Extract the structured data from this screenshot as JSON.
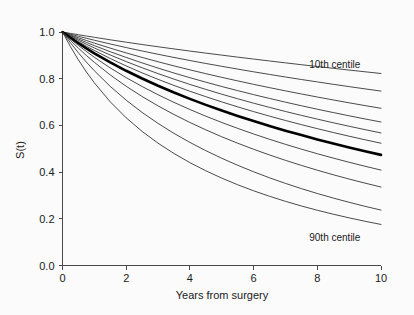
{
  "chart_data": {
    "type": "line",
    "title": "",
    "subtitle": "",
    "xlabel": "Years from surgery",
    "ylabel": "S(t)",
    "xlim": [
      0,
      10
    ],
    "ylim": [
      0.0,
      1.0
    ],
    "xticks": [
      0,
      2,
      4,
      6,
      8,
      10
    ],
    "xtick_labels": [
      "0",
      "2",
      "4",
      "6",
      "8",
      "10"
    ],
    "yticks": [
      0.0,
      0.2,
      0.4,
      0.6,
      0.8,
      1.0
    ],
    "ytick_labels": [
      "0.0",
      "0.2",
      "0.4",
      "0.6",
      "0.8",
      "1.0"
    ],
    "grid": false,
    "legend_position": "none",
    "annotations": [
      {
        "text": "10th centile",
        "x": 8.55,
        "y": 0.845,
        "name": "annotation-10th-centile"
      },
      {
        "text": "90th centile",
        "x": 8.55,
        "y": 0.105,
        "name": "annotation-90th-centile"
      }
    ],
    "x": [
      0,
      0.25,
      0.5,
      0.75,
      1,
      1.5,
      2,
      2.5,
      3,
      3.5,
      4,
      4.5,
      5,
      5.5,
      6,
      6.5,
      7,
      7.5,
      8,
      8.5,
      9,
      9.5,
      10
    ],
    "series": [
      {
        "name": "10th centile",
        "emphasis": "thin",
        "values": [
          1.0,
          0.9941,
          0.9884,
          0.9828,
          0.9773,
          0.9666,
          0.9563,
          0.9464,
          0.9368,
          0.9275,
          0.9184,
          0.9096,
          0.9009,
          0.8924,
          0.8841,
          0.8759,
          0.8679,
          0.86,
          0.8522,
          0.8446,
          0.837,
          0.8296,
          0.8223
        ]
      },
      {
        "name": "centile 2",
        "emphasis": "thin",
        "values": [
          1.0,
          0.9907,
          0.9818,
          0.9732,
          0.9648,
          0.9487,
          0.9333,
          0.9187,
          0.9046,
          0.891,
          0.8779,
          0.8652,
          0.853,
          0.8411,
          0.8295,
          0.8183,
          0.8073,
          0.7966,
          0.7862,
          0.776,
          0.7661,
          0.7564,
          0.7469
        ]
      },
      {
        "name": "centile 3",
        "emphasis": "thin",
        "values": [
          1.0,
          0.9874,
          0.9753,
          0.9637,
          0.9524,
          0.9309,
          0.9105,
          0.8911,
          0.8726,
          0.8549,
          0.8379,
          0.8215,
          0.8058,
          0.7906,
          0.7759,
          0.7617,
          0.7479,
          0.7346,
          0.7216,
          0.709,
          0.6967,
          0.6848,
          0.6732
        ]
      },
      {
        "name": "centile 4",
        "emphasis": "thin",
        "values": [
          1.0,
          0.9845,
          0.9696,
          0.9554,
          0.9417,
          0.9155,
          0.8909,
          0.8676,
          0.8455,
          0.8244,
          0.8043,
          0.7851,
          0.7666,
          0.7489,
          0.7318,
          0.7154,
          0.6995,
          0.6842,
          0.6693,
          0.655,
          0.6411,
          0.6276,
          0.6145
        ]
      },
      {
        "name": "centile 5",
        "emphasis": "thin",
        "values": [
          1.0,
          0.9817,
          0.9643,
          0.9476,
          0.9317,
          0.9015,
          0.8733,
          0.8468,
          0.8218,
          0.7981,
          0.7755,
          0.7541,
          0.7336,
          0.714,
          0.6952,
          0.6771,
          0.6597,
          0.643,
          0.6269,
          0.6113,
          0.5963,
          0.5818,
          0.5677
        ]
      },
      {
        "name": "centile 6",
        "emphasis": "thin",
        "values": [
          1.0,
          0.9786,
          0.9583,
          0.9391,
          0.9208,
          0.8864,
          0.8546,
          0.825,
          0.7972,
          0.7711,
          0.7463,
          0.7229,
          0.7006,
          0.6794,
          0.6591,
          0.6397,
          0.6211,
          0.6032,
          0.5861,
          0.5696,
          0.5537,
          0.5384,
          0.5236
        ]
      },
      {
        "name": "median",
        "emphasis": "thick",
        "values": [
          1.0,
          0.9752,
          0.9518,
          0.9297,
          0.9088,
          0.8697,
          0.8339,
          0.8007,
          0.7698,
          0.7408,
          0.7136,
          0.6879,
          0.6636,
          0.6405,
          0.6185,
          0.5975,
          0.5775,
          0.5584,
          0.54,
          0.5224,
          0.5055,
          0.4893,
          0.4737
        ]
      },
      {
        "name": "centile 8",
        "emphasis": "thin",
        "values": [
          1.0,
          0.9705,
          0.9427,
          0.9166,
          0.8919,
          0.8461,
          0.8046,
          0.7665,
          0.7313,
          0.6986,
          0.6681,
          0.6395,
          0.6126,
          0.5873,
          0.5633,
          0.5405,
          0.5189,
          0.4983,
          0.4787,
          0.46,
          0.4421,
          0.425,
          0.4086
        ]
      },
      {
        "name": "centile 9",
        "emphasis": "thin",
        "values": [
          1.0,
          0.9643,
          0.9308,
          0.8995,
          0.8701,
          0.816,
          0.7676,
          0.7237,
          0.6836,
          0.6467,
          0.6126,
          0.5809,
          0.5513,
          0.5237,
          0.4978,
          0.4734,
          0.4504,
          0.4287,
          0.4081,
          0.3887,
          0.3702,
          0.3527,
          0.336
        ]
      },
      {
        "name": "centile 10",
        "emphasis": "thin",
        "values": [
          1.0,
          0.9538,
          0.9109,
          0.8711,
          0.8341,
          0.767,
          0.708,
          0.6555,
          0.6085,
          0.5659,
          0.5272,
          0.4918,
          0.4592,
          0.4292,
          0.4014,
          0.3756,
          0.3516,
          0.3293,
          0.3084,
          0.2889,
          0.2706,
          0.2534,
          0.2373
        ]
      },
      {
        "name": "90th centile",
        "emphasis": "thin",
        "values": [
          1.0,
          0.9373,
          0.8805,
          0.829,
          0.7823,
          0.7008,
          0.6325,
          0.5742,
          0.5238,
          0.4796,
          0.4405,
          0.4056,
          0.3742,
          0.3458,
          0.32,
          0.2964,
          0.2748,
          0.2549,
          0.2366,
          0.2197,
          0.204,
          0.1894,
          0.1758
        ]
      }
    ]
  },
  "colors": {
    "background": "#fbfbfb",
    "axis": "#4a4a4a",
    "curve_thin": "#2b2b2b",
    "curve_thick": "#000000",
    "text": "#1a1a1a"
  }
}
